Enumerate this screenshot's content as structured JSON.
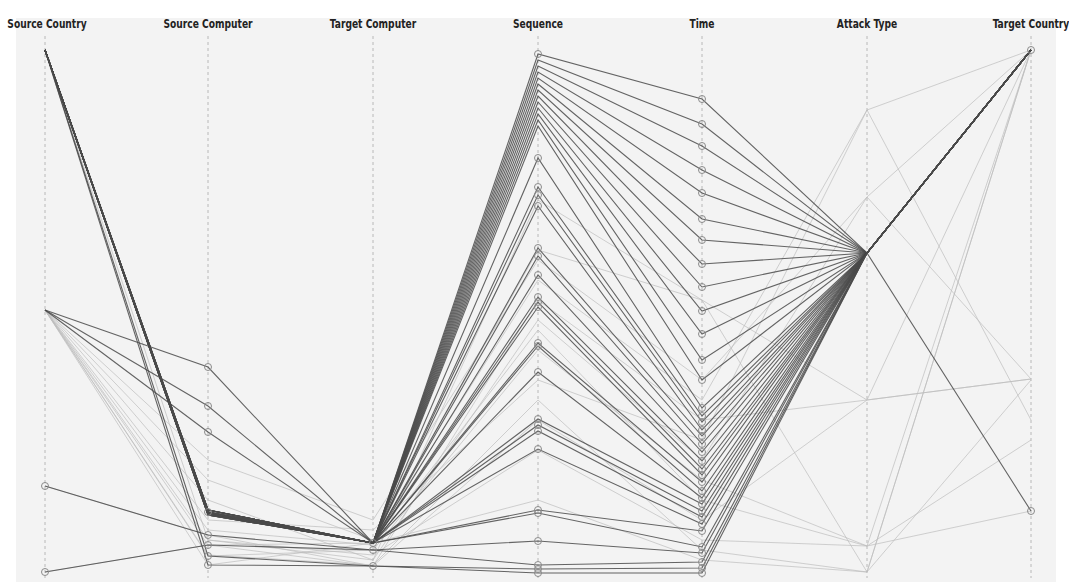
{
  "chart_data": {
    "type": "parallel_coordinates",
    "title": "",
    "axes": [
      {
        "name": "Source Country",
        "x": 45
      },
      {
        "name": "Source Computer",
        "x": 208
      },
      {
        "name": "Target Computer",
        "x": 373
      },
      {
        "name": "Sequence",
        "x": 538
      },
      {
        "name": "Time",
        "x": 702
      },
      {
        "name": "Attack Type",
        "x": 867
      },
      {
        "name": "Target Country",
        "x": 1031
      }
    ],
    "y_range": [
      50,
      575
    ],
    "grid": false,
    "legend": "none",
    "highlighted_lines_note": "Selected records (dark) pass through Target Computer node at y≈543 and converge at Attack Type node at y≈253; background (light) lines show full dataset.",
    "highlighted_lines": [
      [
        50,
        510,
        543,
        54,
        99,
        253,
        50
      ],
      [
        50,
        510,
        543,
        60,
        124,
        253,
        50
      ],
      [
        50,
        512,
        543,
        66,
        146,
        253,
        50
      ],
      [
        50,
        513,
        543,
        72,
        170,
        253,
        50
      ],
      [
        50,
        514,
        543,
        78,
        193,
        253,
        50
      ],
      [
        50,
        515,
        543,
        84,
        219,
        253,
        50
      ],
      [
        50,
        510,
        543,
        90,
        240,
        253,
        50
      ],
      [
        50,
        512,
        543,
        96,
        264,
        253,
        50
      ],
      [
        50,
        513,
        543,
        102,
        287,
        253,
        50
      ],
      [
        50,
        514,
        543,
        108,
        311,
        253,
        50
      ],
      [
        50,
        515,
        543,
        114,
        334,
        253,
        50
      ],
      [
        50,
        510,
        543,
        120,
        360,
        253,
        50
      ],
      [
        50,
        512,
        543,
        126,
        380,
        253,
        50
      ],
      [
        310,
        367,
        543,
        158,
        408,
        253,
        50
      ],
      [
        310,
        406,
        543,
        187,
        416,
        253,
        50
      ],
      [
        310,
        432,
        543,
        195,
        422,
        253,
        50
      ],
      [
        50,
        513,
        543,
        206,
        430,
        253,
        50
      ],
      [
        50,
        514,
        543,
        248,
        436,
        253,
        50
      ],
      [
        50,
        515,
        543,
        256,
        444,
        253,
        50
      ],
      [
        50,
        510,
        543,
        275,
        452,
        253,
        50
      ],
      [
        50,
        512,
        543,
        297,
        461,
        253,
        50
      ],
      [
        50,
        513,
        543,
        302,
        469,
        253,
        50
      ],
      [
        50,
        514,
        543,
        307,
        475,
        253,
        50
      ],
      [
        50,
        515,
        543,
        343,
        482,
        253,
        50
      ],
      [
        50,
        510,
        543,
        346,
        491,
        253,
        50
      ],
      [
        50,
        512,
        543,
        372,
        498,
        253,
        50
      ],
      [
        50,
        513,
        543,
        419,
        504,
        253,
        50
      ],
      [
        50,
        514,
        543,
        425,
        511,
        253,
        50
      ],
      [
        50,
        515,
        543,
        431,
        517,
        253,
        50
      ],
      [
        50,
        510,
        543,
        449,
        524,
        253,
        50
      ],
      [
        50,
        512,
        543,
        510,
        531,
        253,
        50
      ],
      [
        50,
        513,
        543,
        513,
        547,
        253,
        50
      ],
      [
        486,
        535,
        550,
        541,
        553,
        253,
        50
      ],
      [
        572,
        545,
        550,
        565,
        562,
        253,
        50
      ],
      [
        50,
        556,
        566,
        569,
        568,
        253,
        50
      ],
      [
        50,
        565,
        566,
        573,
        573,
        253,
        511
      ]
    ],
    "background_lines": [
      [
        310,
        545,
        566,
        300,
        420,
        400,
        379
      ],
      [
        310,
        556,
        550,
        350,
        480,
        546,
        511
      ],
      [
        310,
        565,
        543,
        250,
        300,
        572,
        50
      ],
      [
        486,
        535,
        566,
        420,
        520,
        400,
        50
      ],
      [
        572,
        545,
        543,
        500,
        560,
        572,
        50
      ],
      [
        310,
        520,
        530,
        380,
        440,
        110,
        50
      ],
      [
        310,
        500,
        560,
        320,
        460,
        197,
        379
      ],
      [
        310,
        480,
        540,
        280,
        400,
        110,
        420
      ],
      [
        310,
        540,
        555,
        450,
        540,
        546,
        440
      ],
      [
        310,
        460,
        520,
        260,
        380,
        197,
        50
      ],
      [
        50,
        540,
        560,
        200,
        300,
        400,
        379
      ],
      [
        310,
        530,
        545,
        330,
        500,
        546,
        50
      ],
      [
        310,
        555,
        565,
        400,
        550,
        572,
        380
      ]
    ],
    "node_markers": {
      "Source Country": [
        486,
        572
      ],
      "Source Computer": [
        367,
        406,
        432,
        512,
        535,
        545,
        556,
        565
      ],
      "Target Computer": [
        543,
        550,
        566
      ],
      "Sequence": [
        54,
        158,
        187,
        195,
        206,
        248,
        256,
        275,
        297,
        302,
        307,
        343,
        346,
        372,
        419,
        425,
        431,
        449,
        510,
        513,
        541,
        565,
        569,
        573
      ],
      "Time": [
        99,
        124,
        146,
        170,
        193,
        219,
        240,
        264,
        287,
        311,
        334,
        360,
        380,
        408,
        416,
        422,
        430,
        436,
        444,
        452,
        461,
        469,
        475,
        482,
        491,
        498,
        504,
        511,
        517,
        524,
        531,
        547,
        553,
        562,
        568,
        573
      ],
      "Attack Type": [],
      "Target Country": [
        50,
        511
      ]
    }
  },
  "style": {
    "highlight_color": "#4a4a4a",
    "background_line_color": "#bdbdbd",
    "axis_color": "#b8b8b8",
    "node_stroke": "#8a8a8a",
    "plot_bg": "#f3f3f3"
  }
}
